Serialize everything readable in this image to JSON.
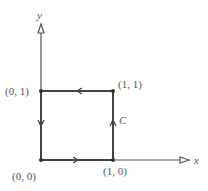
{
  "axes": {
    "x_label": "x",
    "y_label": "y"
  },
  "points": {
    "origin": "(0, 0)",
    "p01": "(0, 1)",
    "p11": "(1, 1)",
    "p10": "(1, 0)"
  },
  "curve_label": "C",
  "colors": {
    "line": "#444444",
    "text": "#555555"
  }
}
